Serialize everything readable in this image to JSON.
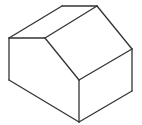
{
  "figure": {
    "stroke_color": "#333333",
    "background": "#ffffff",
    "vertices": {
      "A": [
        62,
        6
      ],
      "B": [
        97,
        6
      ],
      "C": [
        9,
        38
      ],
      "D": [
        45,
        38
      ],
      "E": [
        132,
        49
      ],
      "F": [
        79,
        80
      ],
      "G": [
        9,
        80
      ],
      "H": [
        79,
        122
      ],
      "I": [
        132,
        91
      ]
    },
    "edges": [
      [
        "C",
        "A"
      ],
      [
        "A",
        "B"
      ],
      [
        "C",
        "D"
      ],
      [
        "D",
        "B"
      ],
      [
        "B",
        "E"
      ],
      [
        "D",
        "F"
      ],
      [
        "F",
        "E"
      ],
      [
        "C",
        "G"
      ],
      [
        "G",
        "H"
      ],
      [
        "F",
        "H"
      ],
      [
        "E",
        "I"
      ],
      [
        "I",
        "H"
      ]
    ]
  }
}
